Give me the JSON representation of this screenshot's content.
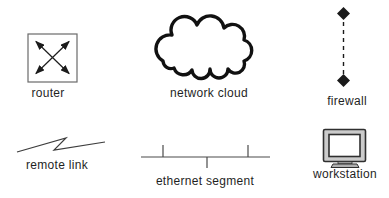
{
  "diagram": {
    "background": "#ffffff",
    "colors": {
      "line": "#2b2b2b",
      "box_stroke": "#6a6a6a",
      "thin_line": "#4a4a4a",
      "cloud_stroke": "#111111",
      "cloud_fill": "#ffffff",
      "diamond_fill": "#1a1a1a",
      "monitor_bezel": "#cbcbcb",
      "monitor_screen": "#ffffff",
      "monitor_base": "#b0b0b0",
      "text": "#1f1f1f"
    },
    "items": [
      {
        "label": "router",
        "symbol": "router-icon"
      },
      {
        "label": "network cloud",
        "symbol": "network-cloud-icon"
      },
      {
        "label": "firewall",
        "symbol": "firewall-icon"
      },
      {
        "label": "remote link",
        "symbol": "remote-link-icon"
      },
      {
        "label": "ethernet segment",
        "symbol": "ethernet-segment-icon"
      },
      {
        "label": "workstation",
        "symbol": "workstation-icon"
      }
    ]
  }
}
